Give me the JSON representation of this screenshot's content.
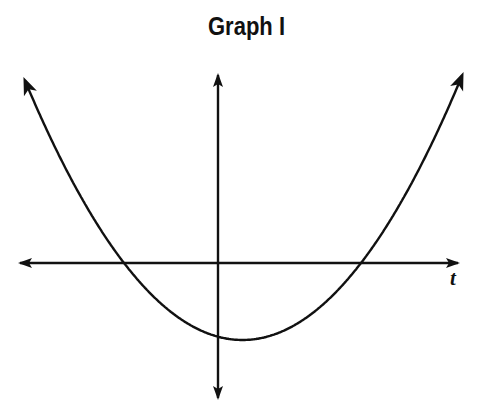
{
  "title": "Graph I",
  "colors": {
    "background": "#ffffff",
    "ink": "#111111"
  },
  "chart_data": {
    "type": "line",
    "title": "Graph I",
    "xlabel": "t",
    "ylabel": "",
    "grid": false,
    "legend": null,
    "x_tick_labels": [],
    "y_tick_labels": [],
    "series": [
      {
        "name": "curve",
        "shape": "parabola",
        "opens": "up",
        "approx_roots_relative": [
          -0.94,
          1.42
        ],
        "approx_vertex_relative": {
          "t": 0.24,
          "y": -0.77
        },
        "approx_y_intercept_relative": -0.73,
        "points_pixel": [
          [
            25,
            81
          ],
          [
            60,
            157
          ],
          [
            100,
            229
          ],
          [
            124,
            263
          ],
          [
            160,
            303
          ],
          [
            200,
            330
          ],
          [
            218,
            336
          ],
          [
            242,
            340
          ],
          [
            280,
            332
          ],
          [
            320,
            307
          ],
          [
            361,
            263
          ],
          [
            400,
            204
          ],
          [
            440,
            126
          ],
          [
            462,
            82
          ]
        ]
      }
    ],
    "axes": {
      "horizontal": {
        "label": "t",
        "y_pixel": 263,
        "x_range_pixel": [
          20,
          458
        ],
        "arrows": "both"
      },
      "vertical": {
        "label": "",
        "x_pixel": 218,
        "y_range_pixel": [
          75,
          398
        ],
        "arrows": "both"
      }
    }
  }
}
